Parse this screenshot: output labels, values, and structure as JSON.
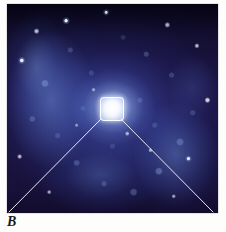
{
  "figure": {
    "panel_label": "B",
    "caption_letter_style": "italic-serif"
  },
  "photo": {
    "alt_description": "Deep-space photograph of a face-on spiral galaxy with a bright white nucleus, blue spiral arms and scattered foreground stars",
    "frame": {
      "x": 7,
      "y": 4,
      "width": 211,
      "height": 209
    },
    "background_color": "#1a1340",
    "core_color": "#ffffff",
    "arm_color": "#7aa0f0",
    "deep_sky_color": "#0a0718"
  },
  "callout": {
    "name": "magnification-callout",
    "box": {
      "x": 93,
      "y": 93,
      "width": 22,
      "height": 22,
      "corner_radius": 4
    },
    "line_color": "#e8e8f2",
    "line_width": 1,
    "lines": [
      {
        "name": "callout-line-left",
        "x1": 94,
        "y1": 115,
        "x2": 2,
        "y2": 208
      },
      {
        "name": "callout-line-right",
        "x1": 114,
        "y1": 115,
        "x2": 206,
        "y2": 208
      }
    ]
  },
  "page": {
    "background_color": "#fdfdfc",
    "border_color": "#c9c9d2"
  }
}
